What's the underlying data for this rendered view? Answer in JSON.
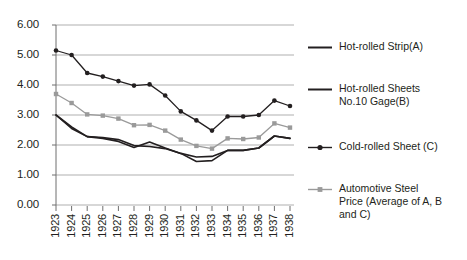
{
  "chart_data": {
    "type": "line",
    "title": "",
    "subtitle": "",
    "xlabel": "",
    "ylabel": "",
    "categories": [
      "1923",
      "1924",
      "1925",
      "1926",
      "1927",
      "1928",
      "1929",
      "1930",
      "1931",
      "1932",
      "1933",
      "1934",
      "1935",
      "1936",
      "1937",
      "1938"
    ],
    "x": [
      1923,
      1924,
      1925,
      1926,
      1927,
      1928,
      1929,
      1930,
      1931,
      1932,
      1933,
      1934,
      1935,
      1936,
      1937,
      1938
    ],
    "ylim": [
      0,
      6
    ],
    "ytick_labels": [
      "0.00",
      "1.00",
      "2.00",
      "3.00",
      "4.00",
      "5.00",
      "6.00"
    ],
    "ytick_values": [
      0,
      1,
      2,
      3,
      4,
      5,
      6
    ],
    "grid": "horizontal",
    "legend_position": "right",
    "series": [
      {
        "name": "Hot-rolled Strip(A)",
        "key": "A",
        "color": "#231f20",
        "marker": "none",
        "values": [
          3.0,
          2.6,
          2.28,
          2.25,
          2.18,
          1.98,
          1.95,
          1.88,
          1.72,
          1.6,
          1.62,
          1.82,
          1.82,
          1.9,
          2.3,
          2.22
        ]
      },
      {
        "name": "Hot-rolled Sheets No.10 Gage(B)",
        "key": "B",
        "color": "#231f20",
        "marker": "none",
        "values": [
          3.0,
          2.55,
          2.28,
          2.22,
          2.12,
          1.92,
          2.1,
          1.9,
          1.72,
          1.45,
          1.48,
          1.82,
          1.82,
          1.9,
          2.3,
          2.22
        ]
      },
      {
        "name": "Cold-rolled Sheet (C)",
        "key": "C",
        "color": "#231f20",
        "marker": "circle",
        "values": [
          5.15,
          5.0,
          4.4,
          4.28,
          4.13,
          3.98,
          4.02,
          3.65,
          3.12,
          2.82,
          2.48,
          2.95,
          2.95,
          3.0,
          3.48,
          3.3
        ]
      },
      {
        "name": "Automotive Steel Price (Average of A, B and C)",
        "key": "AVG",
        "color": "#9a9a9a",
        "marker": "square",
        "values": [
          3.7,
          3.4,
          3.02,
          2.98,
          2.88,
          2.66,
          2.67,
          2.48,
          2.18,
          1.97,
          1.88,
          2.22,
          2.2,
          2.25,
          2.72,
          2.58
        ]
      }
    ]
  },
  "legend": {
    "items": [
      {
        "label": "Hot-rolled Strip(A)",
        "color": "#231f20",
        "marker": "none",
        "icon": "line-swatch-icon"
      },
      {
        "label": "Hot-rolled Sheets\nNo.10 Gage(B)",
        "color": "#231f20",
        "marker": "none",
        "icon": "line-swatch-icon"
      },
      {
        "label": "Cold-rolled Sheet (C)",
        "color": "#231f20",
        "marker": "circle",
        "icon": "line-marker-circle-icon"
      },
      {
        "label": "Automotive Steel\nPrice (Average of A, B\n and C)",
        "color": "#9a9a9a",
        "marker": "square",
        "icon": "line-marker-square-icon"
      }
    ]
  },
  "axes": {
    "gridline_color": "#a6a6a6",
    "axis_color": "#6f6f6f"
  }
}
